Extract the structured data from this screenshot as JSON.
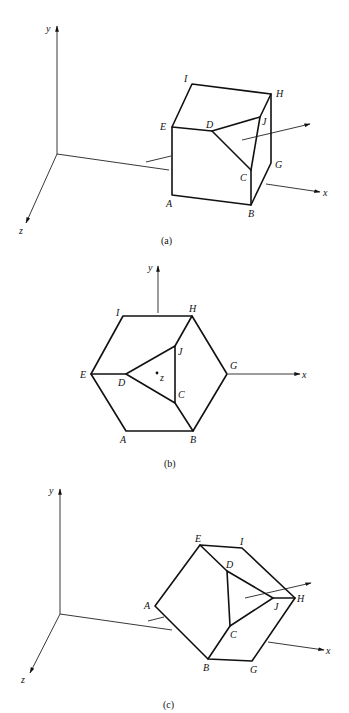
{
  "figures": {
    "a": {
      "caption": "(a)",
      "axes": {
        "x": "x",
        "y": "y",
        "z": "z"
      },
      "vertices": {
        "A": "A",
        "B": "B",
        "C": "C",
        "D": "D",
        "E": "E",
        "G": "G",
        "H": "H",
        "I": "I",
        "J": "J"
      }
    },
    "b": {
      "caption": "(b)",
      "axes": {
        "x": "x",
        "y": "y",
        "z": "z"
      },
      "vertices": {
        "A": "A",
        "B": "B",
        "C": "C",
        "D": "D",
        "E": "E",
        "G": "G",
        "H": "H",
        "I": "I",
        "J": "J"
      }
    },
    "c": {
      "caption": "(c)",
      "axes": {
        "x": "x",
        "y": "y",
        "z": "z"
      },
      "vertices": {
        "A": "A",
        "B": "B",
        "C": "C",
        "D": "D",
        "E": "E",
        "G": "G",
        "H": "H",
        "I": "I",
        "J": "J"
      }
    }
  },
  "colors": {
    "line": "#111111",
    "background": "#ffffff"
  }
}
